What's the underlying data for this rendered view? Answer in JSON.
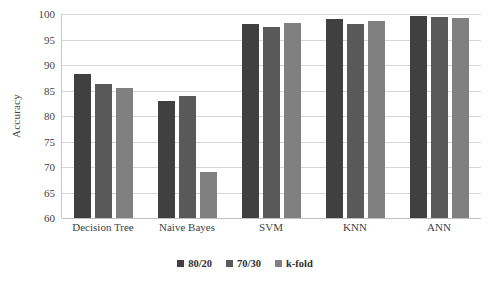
{
  "chart_data": {
    "type": "bar",
    "title": "",
    "xlabel": "",
    "ylabel": "Accuracy",
    "ylim": [
      60,
      100
    ],
    "ytick_step": 5,
    "yticks": [
      100,
      95,
      90,
      85,
      80,
      75,
      70,
      65,
      60
    ],
    "grid": true,
    "legend_position": "bottom-center",
    "categories": [
      "Decision Tree",
      "Naive Bayes",
      "SVM",
      "KNN",
      "ANN"
    ],
    "series": [
      {
        "name": "80/20",
        "color": "#404040",
        "values": [
          88.2,
          83.0,
          98.1,
          99.1,
          99.7
        ]
      },
      {
        "name": "70/30",
        "color": "#595959",
        "values": [
          86.3,
          84.0,
          97.4,
          98.0,
          99.5
        ]
      },
      {
        "name": "k-fold",
        "color": "#808080",
        "values": [
          85.4,
          69.0,
          98.2,
          98.7,
          99.2
        ]
      }
    ]
  },
  "colors": {
    "gridline": "#d6d6d6",
    "axis": "#c9c9c9",
    "text": "#3f3f3f",
    "background": "#ffffff"
  }
}
